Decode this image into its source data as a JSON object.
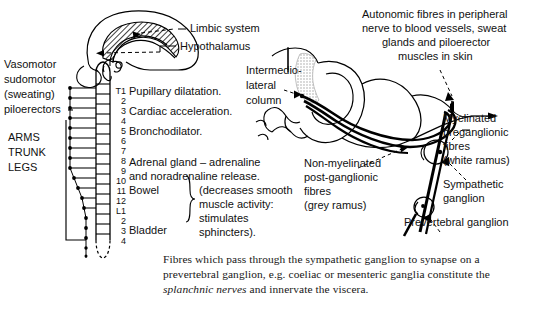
{
  "figure": {
    "background_color": "#ffffff",
    "ink_color": "#000000",
    "shade_color": "#cfcfcf"
  },
  "brain_labels": {
    "limbic": "Limbic system",
    "hypothalamus": "Hypothalamus"
  },
  "left_labels": {
    "line1": "Vasomotor",
    "line2": "sudomotor",
    "line3": "(sweating)",
    "line4": "piloerectors",
    "body1": "ARMS",
    "body2": "TRUNK",
    "body3": "LEGS"
  },
  "spinal_levels": [
    {
      "id": "T1",
      "label": "T1"
    },
    {
      "id": "T2",
      "label": "2"
    },
    {
      "id": "T3",
      "label": "3"
    },
    {
      "id": "T4",
      "label": "4"
    },
    {
      "id": "T5",
      "label": "5"
    },
    {
      "id": "T6",
      "label": "6"
    },
    {
      "id": "T7",
      "label": "7"
    },
    {
      "id": "T8",
      "label": "8"
    },
    {
      "id": "T9",
      "label": "9"
    },
    {
      "id": "T10",
      "label": "10"
    },
    {
      "id": "T11",
      "label": "11"
    },
    {
      "id": "T12",
      "label": "12"
    },
    {
      "id": "L1",
      "label": "L1"
    },
    {
      "id": "L2",
      "label": "2"
    },
    {
      "id": "L3",
      "label": "3"
    },
    {
      "id": "L4",
      "label": "4"
    }
  ],
  "functions": [
    {
      "level": "T1",
      "text": "Pupillary dilatation."
    },
    {
      "level": "T3",
      "text": "Cardiac acceleration."
    },
    {
      "level": "T4",
      "text": "Bronchodilator."
    },
    {
      "level": "T7",
      "text": "Adrenal gland – adrenaline"
    },
    {
      "level": "T8",
      "text": "and noradrenaline release."
    },
    {
      "level": "T9",
      "text": "Bowel"
    },
    {
      "level": "L1",
      "text": "Bladder"
    }
  ],
  "brace_note": {
    "line1": "(decreases smooth",
    "line2": "muscle activity:",
    "line3": "stimulates",
    "line4": "sphincters)."
  },
  "right_labels": {
    "autonomic_fibres": {
      "line1": "Autonomic fibres in peripheral",
      "line2": "nerve to blood vessels, sweat",
      "line3": "glands and piloerector",
      "line4": "muscles in skin"
    },
    "intermediolateral": {
      "line1": "Intermedio-",
      "line2": "lateral",
      "line3": "column"
    },
    "myelinated": {
      "line1": "Myelinated",
      "line2": "preganglionic",
      "line3": "fibres",
      "line4": "(white ramus)"
    },
    "non_myelinated": {
      "line1": "Non-myelinated",
      "line2": "post-ganglionic",
      "line3": "fibres",
      "line4": "(grey ramus)"
    },
    "sympathetic_ganglion": {
      "line1": "Sympathetic",
      "line2": "ganglion"
    },
    "prevertebral_ganglion": "Prevertebral ganglion"
  },
  "caption": {
    "part1": "Fibres which pass through the sympathetic ganglion to synapse on a prevertebral ganglion, e.g. coeliac or mesenteric ganglia constitute the ",
    "italic": "splanchnic nerves",
    "part2": " and innervate the viscera."
  }
}
